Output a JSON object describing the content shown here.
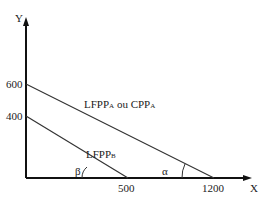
{
  "diagram": {
    "axes": {
      "y_label": "Y",
      "x_label": "X",
      "y_ticks": [
        "600",
        "400"
      ],
      "x_ticks": [
        "500",
        "1200"
      ]
    },
    "lines": [
      {
        "name": "LFPP_A ou CPP_A",
        "label_main_1": "LFPP",
        "label_sub_1": "A",
        "label_middle": " ou CPP",
        "label_sub_2": "A",
        "y_intercept": 600,
        "x_intercept": 1200,
        "angle_label": "α"
      },
      {
        "name": "LFPP_B",
        "label_main": "LFPP",
        "label_sub": "B",
        "y_intercept": 400,
        "x_intercept": 500,
        "angle_label": "β"
      }
    ],
    "colors": {
      "line": "#333333",
      "axis": "#111111",
      "background": "#ffffff"
    }
  }
}
